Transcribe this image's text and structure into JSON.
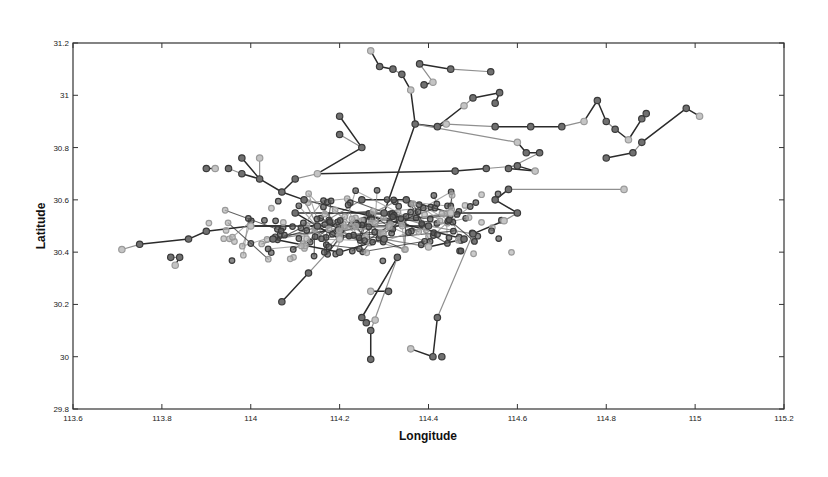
{
  "chart_data": {
    "type": "scatter",
    "subtype": "network-trajectory",
    "title": "",
    "xlabel": "Longitude",
    "ylabel": "Latitude",
    "xlim": [
      113.6,
      115.2
    ],
    "ylim": [
      29.8,
      31.2
    ],
    "xticks": [
      113.6,
      113.8,
      114,
      114.2,
      114.4,
      114.6,
      114.8,
      115,
      115.2
    ],
    "xtick_labels": [
      "113.6",
      "113.8",
      "114",
      "114.2",
      "114.4",
      "114.6",
      "114.8",
      "115",
      "115.2"
    ],
    "yticks": [
      29.8,
      30,
      30.2,
      30.4,
      30.6,
      30.8,
      31,
      31.2
    ],
    "ytick_labels": [
      "29.8",
      "30",
      "30.2",
      "30.4",
      "30.6",
      "30.8",
      "31",
      "31.2"
    ],
    "grid": false,
    "legend": null,
    "marker": "circle",
    "colors": {
      "node_dark": "#3a3a3a",
      "node_light": "#9a9a9a",
      "edge_dark": "#2b2b2b",
      "edge_light": "#8f8f8f",
      "frame": "#333333"
    },
    "dense_cluster": {
      "x_range": [
        113.9,
        114.6
      ],
      "y_range": [
        30.35,
        30.65
      ],
      "approx_nodes": 220
    },
    "nodes": [
      [
        113.71,
        30.41
      ],
      [
        113.75,
        30.43
      ],
      [
        113.82,
        30.38
      ],
      [
        113.84,
        30.38
      ],
      [
        113.83,
        30.35
      ],
      [
        113.86,
        30.45
      ],
      [
        113.9,
        30.48
      ],
      [
        113.9,
        30.72
      ],
      [
        113.92,
        30.72
      ],
      [
        113.95,
        30.72
      ],
      [
        113.98,
        30.7
      ],
      [
        113.98,
        30.76
      ],
      [
        114.02,
        30.76
      ],
      [
        114.02,
        30.68
      ],
      [
        114.07,
        30.63
      ],
      [
        114.1,
        30.68
      ],
      [
        114.15,
        30.7
      ],
      [
        114.2,
        30.92
      ],
      [
        114.2,
        30.85
      ],
      [
        114.25,
        30.8
      ],
      [
        114.27,
        31.17
      ],
      [
        114.29,
        31.11
      ],
      [
        114.32,
        31.1
      ],
      [
        114.34,
        31.08
      ],
      [
        114.36,
        31.02
      ],
      [
        114.38,
        31.12
      ],
      [
        114.45,
        31.1
      ],
      [
        114.54,
        31.09
      ],
      [
        114.41,
        31.05
      ],
      [
        114.39,
        31.04
      ],
      [
        114.37,
        30.89
      ],
      [
        114.42,
        30.88
      ],
      [
        114.48,
        30.96
      ],
      [
        114.5,
        30.99
      ],
      [
        114.56,
        31.01
      ],
      [
        114.55,
        30.97
      ],
      [
        114.44,
        30.89
      ],
      [
        114.55,
        30.88
      ],
      [
        114.63,
        30.88
      ],
      [
        114.7,
        30.88
      ],
      [
        114.75,
        30.9
      ],
      [
        114.78,
        30.98
      ],
      [
        114.8,
        30.9
      ],
      [
        114.82,
        30.87
      ],
      [
        114.85,
        30.83
      ],
      [
        114.88,
        30.91
      ],
      [
        114.89,
        30.93
      ],
      [
        114.98,
        30.95
      ],
      [
        115.01,
        30.92
      ],
      [
        114.88,
        30.82
      ],
      [
        114.86,
        30.78
      ],
      [
        114.8,
        30.76
      ],
      [
        114.6,
        30.82
      ],
      [
        114.62,
        30.78
      ],
      [
        114.65,
        30.78
      ],
      [
        114.58,
        30.72
      ],
      [
        114.64,
        30.71
      ],
      [
        114.6,
        30.73
      ],
      [
        114.53,
        30.72
      ],
      [
        114.46,
        30.71
      ],
      [
        114.84,
        30.64
      ],
      [
        114.58,
        30.64
      ],
      [
        114.55,
        30.6
      ],
      [
        114.6,
        30.55
      ],
      [
        114.57,
        30.52
      ],
      [
        114.5,
        30.47
      ],
      [
        114.07,
        30.21
      ],
      [
        114.13,
        30.32
      ],
      [
        114.27,
        30.25
      ],
      [
        114.31,
        30.25
      ],
      [
        114.25,
        30.15
      ],
      [
        114.26,
        30.13
      ],
      [
        114.28,
        30.14
      ],
      [
        114.27,
        30.1
      ],
      [
        114.27,
        29.99
      ],
      [
        114.42,
        30.15
      ],
      [
        114.36,
        30.03
      ],
      [
        114.41,
        30.0
      ],
      [
        114.43,
        30.0
      ],
      [
        114.33,
        30.38
      ],
      [
        114.2,
        30.45
      ],
      [
        114.1,
        30.55
      ],
      [
        114.3,
        30.55
      ],
      [
        114.4,
        30.5
      ],
      [
        114.0,
        30.5
      ],
      [
        114.15,
        30.5
      ],
      [
        114.25,
        30.6
      ],
      [
        114.35,
        30.6
      ],
      [
        114.45,
        30.55
      ],
      [
        114.05,
        30.45
      ],
      [
        114.2,
        30.4
      ],
      [
        114.3,
        30.45
      ],
      [
        114.4,
        30.42
      ],
      [
        114.48,
        30.45
      ],
      [
        114.12,
        30.6
      ]
    ],
    "edges": [
      [
        0,
        1
      ],
      [
        1,
        5
      ],
      [
        5,
        6
      ],
      [
        2,
        3
      ],
      [
        3,
        4
      ],
      [
        7,
        8
      ],
      [
        9,
        10
      ],
      [
        10,
        13
      ],
      [
        11,
        13
      ],
      [
        12,
        13
      ],
      [
        13,
        14
      ],
      [
        14,
        15
      ],
      [
        15,
        16
      ],
      [
        16,
        19
      ],
      [
        17,
        19
      ],
      [
        18,
        19
      ],
      [
        20,
        21
      ],
      [
        21,
        22
      ],
      [
        22,
        23
      ],
      [
        23,
        24
      ],
      [
        24,
        30
      ],
      [
        25,
        28
      ],
      [
        25,
        26
      ],
      [
        28,
        29
      ],
      [
        26,
        27
      ],
      [
        30,
        31
      ],
      [
        31,
        36
      ],
      [
        36,
        37
      ],
      [
        37,
        38
      ],
      [
        38,
        39
      ],
      [
        39,
        40
      ],
      [
        40,
        41
      ],
      [
        41,
        42
      ],
      [
        42,
        43
      ],
      [
        43,
        44
      ],
      [
        44,
        45
      ],
      [
        45,
        46
      ],
      [
        47,
        48
      ],
      [
        47,
        49
      ],
      [
        49,
        50
      ],
      [
        50,
        51
      ],
      [
        31,
        32
      ],
      [
        32,
        33
      ],
      [
        33,
        34
      ],
      [
        34,
        35
      ],
      [
        30,
        52
      ],
      [
        52,
        53
      ],
      [
        53,
        54
      ],
      [
        54,
        55
      ],
      [
        55,
        56
      ],
      [
        56,
        57
      ],
      [
        57,
        58
      ],
      [
        58,
        59
      ],
      [
        59,
        16
      ],
      [
        61,
        60
      ],
      [
        61,
        62
      ],
      [
        62,
        63
      ],
      [
        63,
        64
      ],
      [
        64,
        65
      ],
      [
        66,
        67
      ],
      [
        67,
        80
      ],
      [
        68,
        69
      ],
      [
        70,
        71
      ],
      [
        71,
        72
      ],
      [
        73,
        74
      ],
      [
        79,
        70
      ],
      [
        79,
        73
      ],
      [
        75,
        77
      ],
      [
        76,
        77
      ],
      [
        75,
        65
      ],
      [
        80,
        81
      ],
      [
        81,
        82
      ],
      [
        82,
        83
      ],
      [
        83,
        84
      ],
      [
        84,
        85
      ],
      [
        85,
        86
      ],
      [
        86,
        87
      ],
      [
        87,
        88
      ],
      [
        88,
        89
      ],
      [
        89,
        90
      ],
      [
        90,
        91
      ],
      [
        91,
        92
      ],
      [
        92,
        93
      ],
      [
        93,
        94
      ],
      [
        94,
        85
      ],
      [
        6,
        84
      ],
      [
        30,
        82
      ],
      [
        83,
        65
      ],
      [
        88,
        63
      ],
      [
        14,
        94
      ]
    ]
  }
}
